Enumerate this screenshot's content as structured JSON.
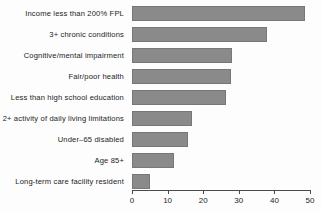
{
  "chart_data": {
    "type": "bar",
    "orientation": "horizontal",
    "title": "",
    "xlabel": "",
    "ylabel": "",
    "xlim": [
      0,
      50
    ],
    "xticks": [
      0,
      10,
      20,
      30,
      40,
      50
    ],
    "grid": false,
    "legend": null,
    "bar_color": "#8a8a8a",
    "bar_edge_color": "#777777",
    "background_color": "#fdfdfd",
    "text_color": "#1c1c1c",
    "categories": [
      "Income less than 200% FPL",
      "3+ chronic conditions",
      "Cognitive/mental impairment",
      "Fair/poor health",
      "Less than high school education",
      "2+ activity of daily living limitations",
      "Under–65 disabled",
      "Age 85+",
      "Long-term care facility resident"
    ],
    "values": [
      48.5,
      38,
      28,
      27.8,
      26.4,
      16.9,
      15.8,
      11.8,
      5
    ]
  }
}
